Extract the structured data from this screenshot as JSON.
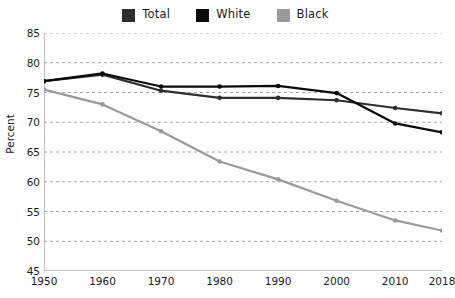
{
  "legend": {
    "position": "top-center",
    "items": [
      {
        "label": "Total",
        "color": "#2e2e2e",
        "icon": "square-swatch"
      },
      {
        "label": "White",
        "color": "#0a0a0a",
        "icon": "square-swatch"
      },
      {
        "label": "Black",
        "color": "#9a9a9a",
        "icon": "square-swatch"
      }
    ]
  },
  "chart_data": {
    "type": "line",
    "title": "",
    "subtitle": "",
    "xlabel": "",
    "ylabel": "Percent",
    "x": [
      1950,
      1960,
      1970,
      1980,
      1990,
      2000,
      2010,
      2018
    ],
    "xtick_labels": [
      "1950",
      "1960",
      "1970",
      "1980",
      "1990",
      "2000",
      "2010",
      "2018"
    ],
    "ytick_labels": [
      "45",
      "50",
      "55",
      "60",
      "65",
      "70",
      "75",
      "80",
      "85"
    ],
    "yticks": [
      45,
      50,
      55,
      60,
      65,
      70,
      75,
      80,
      85
    ],
    "xlim": [
      1950,
      2018
    ],
    "ylim": [
      45,
      85
    ],
    "grid": "horizontal-dashed",
    "markers": "filled-circle",
    "series": [
      {
        "name": "Total",
        "color": "#2e2e2e",
        "values": [
          76.9,
          78.0,
          75.3,
          74.1,
          74.1,
          73.7,
          72.4,
          71.5
        ]
      },
      {
        "name": "White",
        "color": "#0a0a0a",
        "values": [
          76.9,
          78.2,
          76.0,
          76.0,
          76.1,
          74.9,
          69.8,
          68.3
        ]
      },
      {
        "name": "Black",
        "color": "#9a9a9a",
        "values": [
          75.5,
          73.0,
          68.5,
          63.4,
          60.4,
          56.8,
          53.5,
          51.8
        ]
      }
    ]
  }
}
